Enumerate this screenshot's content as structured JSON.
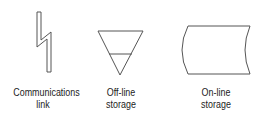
{
  "symbols": [
    {
      "name": "communications-link",
      "label_line1": "Communications",
      "label_line2": "link"
    },
    {
      "name": "off-line-storage",
      "label_line1": "Off-line",
      "label_line2": "storage"
    },
    {
      "name": "on-line-storage",
      "label_line1": "On-line",
      "label_line2": "storage"
    }
  ],
  "colors": {
    "stroke": "#555555",
    "text": "#222222",
    "background": "#ffffff"
  }
}
